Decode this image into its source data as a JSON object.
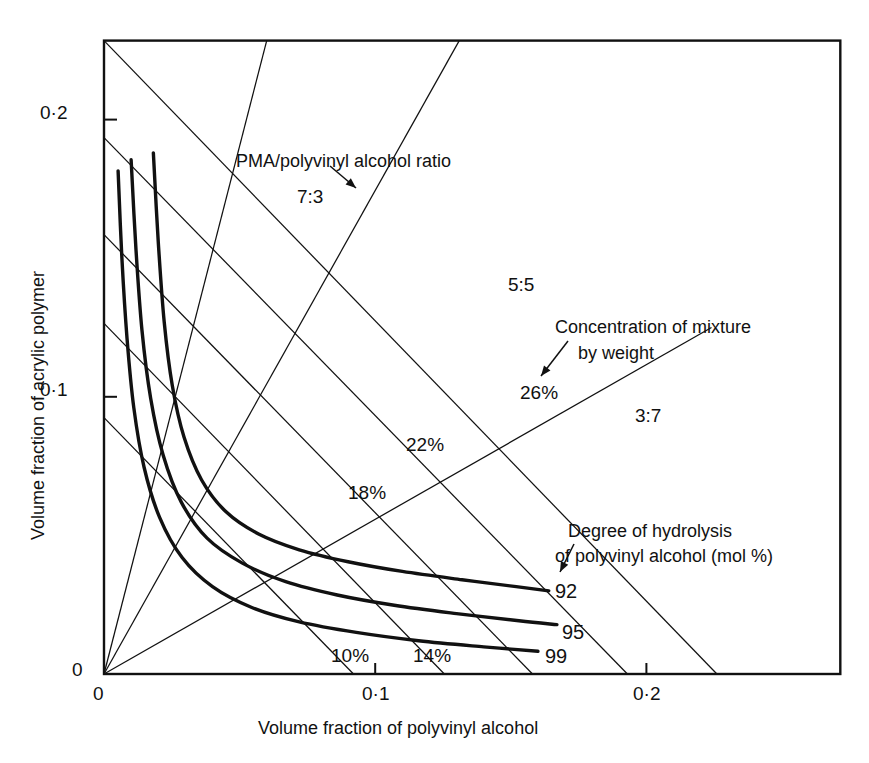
{
  "figure": {
    "background_color": "#ffffff",
    "ink_color": "#111111"
  },
  "axes": {
    "x": {
      "title": "Volume fraction of polyvinyl alcohol",
      "ticks": [
        "0",
        "0·1",
        "0·2"
      ],
      "tick_values": [
        0,
        0.1,
        0.2
      ],
      "range": [
        0,
        0.2715
      ]
    },
    "y": {
      "title": "Volume fraction of acrylic polymer",
      "ticks": [
        "0",
        "0·1",
        "0·2"
      ],
      "tick_values": [
        0,
        0.1,
        0.2
      ],
      "range": [
        0,
        0.2285
      ]
    }
  },
  "annotations": {
    "ratio_caption": "PMA/polyvinyl alcohol ratio",
    "concentration_caption_line1": "Concentration of mixture",
    "concentration_caption_line2": "by weight",
    "hydrolysis_caption_line1": "Degree of hydrolysis",
    "hydrolysis_caption_line2": "of polyvinyl alcohol (mol %)"
  },
  "ratio_labels": [
    "7:3",
    "5:5",
    "3:7"
  ],
  "concentration_labels": [
    "26%",
    "22%",
    "18%",
    "14%",
    "10%"
  ],
  "curve_labels": [
    "92",
    "95",
    "99"
  ],
  "chart_data": {
    "type": "line",
    "title": "",
    "xlabel": "Volume fraction of polyvinyl alcohol",
    "ylabel": "Volume fraction of acrylic polymer",
    "xlim": [
      0,
      0.2715
    ],
    "ylim": [
      0,
      0.2285
    ],
    "xticks": [
      0,
      0.1,
      0.2
    ],
    "xticklabels": [
      "0",
      "0·1",
      "0·2"
    ],
    "yticks": [
      0,
      0.1,
      0.2
    ],
    "yticklabels": [
      "0",
      "0·1",
      "0·2"
    ],
    "grid": false,
    "legend": "inline-labels",
    "series": [
      {
        "name": "92",
        "label": "92",
        "kind": "hydrolysis-isopleth",
        "style": "thick",
        "points": [
          [
            0.0182,
            0.188
          ],
          [
            0.02,
            0.156
          ],
          [
            0.0222,
            0.127
          ],
          [
            0.0252,
            0.104
          ],
          [
            0.0295,
            0.0855
          ],
          [
            0.036,
            0.07
          ],
          [
            0.045,
            0.0585
          ],
          [
            0.057,
            0.0505
          ],
          [
            0.072,
            0.0448
          ],
          [
            0.09,
            0.0405
          ],
          [
            0.11,
            0.037
          ],
          [
            0.132,
            0.034
          ],
          [
            0.152,
            0.0315
          ],
          [
            0.164,
            0.03
          ]
        ]
      },
      {
        "name": "95",
        "label": "95",
        "kind": "hydrolysis-isopleth",
        "style": "thick",
        "points": [
          [
            0.01,
            0.1855
          ],
          [
            0.0118,
            0.153
          ],
          [
            0.014,
            0.124
          ],
          [
            0.0172,
            0.0995
          ],
          [
            0.0218,
            0.079
          ],
          [
            0.0285,
            0.062
          ],
          [
            0.038,
            0.049
          ],
          [
            0.051,
            0.04
          ],
          [
            0.067,
            0.0333
          ],
          [
            0.086,
            0.0285
          ],
          [
            0.107,
            0.0248
          ],
          [
            0.13,
            0.0218
          ],
          [
            0.153,
            0.0192
          ],
          [
            0.167,
            0.0178
          ]
        ]
      },
      {
        "name": "99",
        "label": "99",
        "kind": "hydrolysis-isopleth",
        "style": "thick",
        "points": [
          [
            0.0052,
            0.1815
          ],
          [
            0.0066,
            0.15
          ],
          [
            0.0085,
            0.121
          ],
          [
            0.011,
            0.096
          ],
          [
            0.0148,
            0.0745
          ],
          [
            0.0205,
            0.0565
          ],
          [
            0.0288,
            0.042
          ],
          [
            0.04,
            0.0315
          ],
          [
            0.0545,
            0.024
          ],
          [
            0.072,
            0.0188
          ],
          [
            0.093,
            0.015
          ],
          [
            0.116,
            0.012
          ],
          [
            0.14,
            0.0098
          ],
          [
            0.16,
            0.0082
          ]
        ]
      }
    ],
    "ratio_lines": [
      {
        "label": "7:3",
        "from": [
          0,
          0
        ],
        "to": [
          0.06,
          0.2285
        ],
        "slope_note": "PMA rich"
      },
      {
        "label": "5:5",
        "from": [
          0,
          0
        ],
        "to": [
          0.131,
          0.2285
        ]
      },
      {
        "label": "3:7",
        "from": [
          0,
          0
        ],
        "to": [
          0.224,
          0.125
        ]
      }
    ],
    "concentration_lines": [
      {
        "label": "26%",
        "from": [
          0,
          0.2285
        ],
        "to": [
          0.226,
          0
        ]
      },
      {
        "label": "22%",
        "from": [
          0,
          0.1935
        ],
        "to": [
          0.193,
          0
        ]
      },
      {
        "label": "18%",
        "from": [
          0,
          0.1585
        ],
        "to": [
          0.158,
          0
        ]
      },
      {
        "label": "14%",
        "from": [
          0,
          0.1265
        ],
        "to": [
          0.1255,
          0
        ]
      },
      {
        "label": "10%",
        "from": [
          0,
          0.0925
        ],
        "to": [
          0.092,
          0
        ]
      }
    ]
  }
}
